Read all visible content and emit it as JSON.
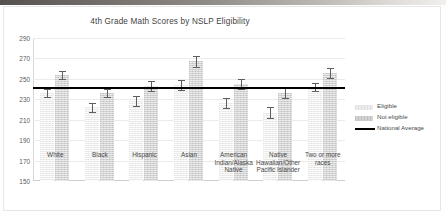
{
  "chart_data": {
    "type": "bar",
    "title": "4th Grade Math Scores by NSLP Eligibility",
    "xlabel": "",
    "ylabel": "",
    "ylim": [
      150,
      290
    ],
    "yticks": [
      290,
      270,
      250,
      230,
      210,
      190,
      170,
      150
    ],
    "grid": true,
    "legend_position": "right",
    "categories": [
      "White",
      "Black",
      "Hispanic",
      "Asian",
      "American Indian/Alaska Native",
      "Native Hawaiian/Other Pacific Islander",
      "Two or more races"
    ],
    "category_lines": [
      [
        "White"
      ],
      [
        "Black"
      ],
      [
        "Hispanic"
      ],
      [
        "Asian"
      ],
      [
        "American",
        "Indian/Alaska",
        "Native"
      ],
      [
        "Native",
        "Hawaiian/Other",
        "Pacific Islander"
      ],
      [
        "Two or more",
        "races"
      ]
    ],
    "series": [
      {
        "name": "Eligible",
        "color": "#ececec",
        "values": [
          236,
          222,
          228,
          244,
          226,
          217,
          242
        ],
        "errors": [
          4,
          4,
          5,
          5,
          5,
          5,
          4
        ]
      },
      {
        "name": "Not eligible",
        "color": "#d2d2d2",
        "values": [
          254,
          236,
          243,
          267,
          245,
          236,
          256
        ],
        "errors": [
          4,
          4,
          5,
          5,
          5,
          5,
          5
        ]
      }
    ],
    "reference_line": {
      "name": "National Average",
      "value": 241,
      "color": "#000000"
    }
  },
  "legend": {
    "items": [
      {
        "label": "Eligible",
        "kind": "swatch-eligible"
      },
      {
        "label": "Not eligible",
        "kind": "swatch-noteligible"
      },
      {
        "label": "National Average",
        "kind": "line"
      }
    ]
  }
}
